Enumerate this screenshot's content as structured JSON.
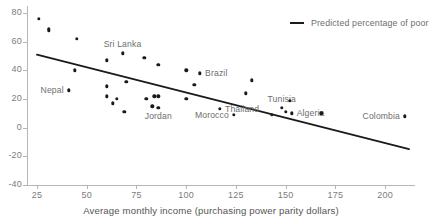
{
  "chart_data": {
    "type": "scatter",
    "title": "",
    "xlabel": "Average monthly income (purchasing power parity dollars)",
    "ylabel": "",
    "xlim": [
      20,
      215
    ],
    "ylim": [
      -40,
      85
    ],
    "grid": false,
    "legend_position": "top-right",
    "xticks": [
      25,
      50,
      75,
      100,
      125,
      150,
      175,
      200
    ],
    "yticks": [
      80,
      60,
      40,
      20,
      0,
      -20,
      -40
    ],
    "series": [
      {
        "name": "Percentage of poor",
        "type": "scatter",
        "points": [
          {
            "x": 26,
            "y": 76,
            "label": ""
          },
          {
            "x": 31,
            "y": 69,
            "label": ""
          },
          {
            "x": 31,
            "y": 68,
            "label": ""
          },
          {
            "x": 45,
            "y": 62,
            "label": ""
          },
          {
            "x": 44,
            "y": 40,
            "label": ""
          },
          {
            "x": 41,
            "y": 26,
            "label": "Nepal"
          },
          {
            "x": 60,
            "y": 47,
            "label": ""
          },
          {
            "x": 68,
            "y": 52,
            "label": "Sri Lanka"
          },
          {
            "x": 79,
            "y": 49,
            "label": ""
          },
          {
            "x": 86,
            "y": 44,
            "label": ""
          },
          {
            "x": 60,
            "y": 29,
            "label": ""
          },
          {
            "x": 70,
            "y": 32,
            "label": ""
          },
          {
            "x": 60,
            "y": 22,
            "label": ""
          },
          {
            "x": 63,
            "y": 17,
            "label": ""
          },
          {
            "x": 65,
            "y": 20,
            "label": ""
          },
          {
            "x": 69,
            "y": 11,
            "label": ""
          },
          {
            "x": 80,
            "y": 20,
            "label": ""
          },
          {
            "x": 84,
            "y": 22,
            "label": ""
          },
          {
            "x": 86,
            "y": 22,
            "label": ""
          },
          {
            "x": 83,
            "y": 15,
            "label": ""
          },
          {
            "x": 86,
            "y": 14,
            "label": "Jordan"
          },
          {
            "x": 100,
            "y": 40,
            "label": ""
          },
          {
            "x": 107,
            "y": 38,
            "label": "Brazil"
          },
          {
            "x": 104,
            "y": 30,
            "label": ""
          },
          {
            "x": 100,
            "y": 20,
            "label": ""
          },
          {
            "x": 117,
            "y": 13,
            "label": "Thailand"
          },
          {
            "x": 124,
            "y": 9,
            "label": "Morocco"
          },
          {
            "x": 130,
            "y": 24,
            "label": ""
          },
          {
            "x": 133,
            "y": 33,
            "label": ""
          },
          {
            "x": 143,
            "y": 9,
            "label": ""
          },
          {
            "x": 148,
            "y": 14,
            "label": "Tunisia"
          },
          {
            "x": 150,
            "y": 11,
            "label": ""
          },
          {
            "x": 153,
            "y": 10,
            "label": "Algeria"
          },
          {
            "x": 152,
            "y": 19,
            "label": ""
          },
          {
            "x": 168,
            "y": 10,
            "label": ""
          },
          {
            "x": 210,
            "y": 8,
            "label": "Colombia"
          }
        ]
      },
      {
        "name": "Predicted percentage of poor",
        "type": "line",
        "endpoints": [
          {
            "x": 25,
            "y": 51
          },
          {
            "x": 212,
            "y": -15
          }
        ]
      }
    ]
  },
  "legend": {
    "marker": "line-swatch",
    "label": "Predicted percentage of poor"
  },
  "axes": {
    "x_title": "Average monthly income (purchasing power parity dollars)",
    "x_tick_labels": [
      "25",
      "50",
      "75",
      "100",
      "125",
      "150",
      "175",
      "200"
    ],
    "y_tick_labels": [
      "80",
      "60",
      "40",
      "20",
      "0",
      "-20",
      "-40"
    ]
  },
  "colors": {
    "point": "#1a1a1a",
    "line": "#1a1a1a",
    "axis": "#b6b6b6",
    "tick_text": "#7d7d7d",
    "label_text": "#6e6e6e"
  }
}
